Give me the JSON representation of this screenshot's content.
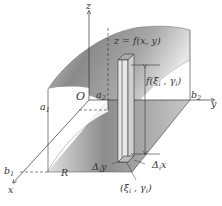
{
  "diagram": {
    "type": "3d-double-integral-riemann-sum",
    "axes": {
      "z": "z",
      "y": "y",
      "x": "x",
      "origin": "O"
    },
    "bounds": {
      "a1": {
        "base": "a",
        "sub": "1"
      },
      "b1": {
        "base": "b",
        "sub": "1"
      },
      "a2": {
        "base": "a",
        "sub": "2"
      },
      "b2": {
        "base": "b",
        "sub": "2"
      }
    },
    "surface_label": "z = f(x, y)",
    "height_label": {
      "prefix": "f(",
      "xi": "ξ",
      "i1": "i",
      "sep": " , ",
      "gamma": "γ",
      "i2": "i",
      "suffix": ")"
    },
    "region_label": "R",
    "delta_y_label": {
      "base": "Δ",
      "sub": "i",
      "var": "y"
    },
    "delta_x_label": {
      "base": "Δ",
      "sub": "i",
      "var": "x"
    },
    "point_label": {
      "prefix": "(",
      "xi": "ξ",
      "i1": "i",
      "sep": " , ",
      "gamma": "γ",
      "i2": "i",
      "suffix": ")"
    },
    "colors": {
      "surface_dark": "#7a7a7a",
      "surface_light": "#e8e8e8",
      "line": "#333333",
      "background": "#ffffff"
    }
  }
}
